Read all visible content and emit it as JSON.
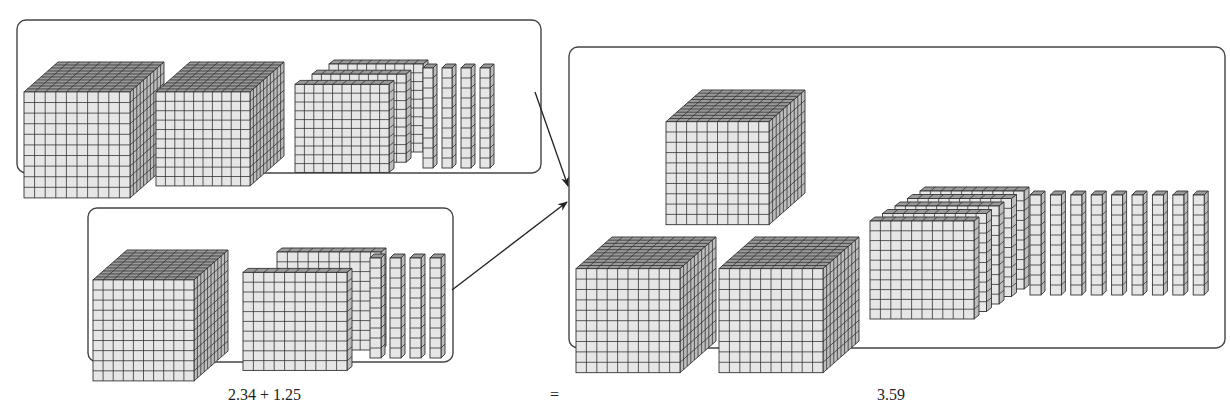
{
  "colors": {
    "face": "#e6e6e6",
    "top": "#9a9a9a",
    "side": "#bdbdbd",
    "line": "#333333",
    "frame": "#444444",
    "text": "#222222"
  },
  "equation": {
    "left": "2.34 + 1.25",
    "equals": "=",
    "result": "3.59"
  },
  "groups": [
    {
      "id": "addend-1",
      "value": "2.34",
      "box": {
        "x": 17,
        "y": 20,
        "w": 524,
        "h": 153
      },
      "ones": 2,
      "tenths": 3,
      "hundredths": 4,
      "cubes": [
        {
          "x": 24,
          "y": 62,
          "s": 106,
          "d": 34
        },
        {
          "x": 156,
          "y": 62,
          "s": 94,
          "d": 34
        }
      ],
      "flats": {
        "x": 295,
        "y": 62,
        "s": 94,
        "d": 34,
        "count": 3
      },
      "rods": {
        "x": 423,
        "y": 62,
        "h": 104,
        "w": 10,
        "gap": 19,
        "count": 4
      }
    },
    {
      "id": "addend-2",
      "value": "1.25",
      "box": {
        "x": 88,
        "y": 208,
        "w": 365,
        "h": 154
      },
      "ones": 1,
      "tenths": 2,
      "hundredths": 5,
      "cubes": [
        {
          "x": 93,
          "y": 250,
          "s": 101,
          "d": 34
        }
      ],
      "flats": {
        "x": 243,
        "y": 250,
        "s": 104,
        "d": 34,
        "count": 2
      },
      "rods": {
        "x": 370,
        "y": 252,
        "h": 104,
        "w": 11,
        "gap": 20,
        "count": 4
      }
    },
    {
      "id": "sum",
      "value": "3.59",
      "box": {
        "x": 569,
        "y": 47,
        "w": 656,
        "h": 301
      },
      "ones": 3,
      "tenths": 5,
      "hundredths": 9,
      "cubes": [
        {
          "x": 666,
          "y": 90,
          "s": 103,
          "d": 36
        },
        {
          "x": 576,
          "y": 237,
          "s": 104,
          "d": 36
        },
        {
          "x": 719,
          "y": 237,
          "s": 104,
          "d": 36
        }
      ],
      "flats": {
        "x": 870,
        "y": 189,
        "s": 104,
        "d": 50,
        "count": 5
      },
      "rods": {
        "x": 1030,
        "y": 189,
        "h": 104,
        "w": 11,
        "gap": 20.4,
        "count": 9
      }
    }
  ],
  "arrows": [
    {
      "from": [
        535,
        92
      ],
      "to": [
        568,
        186
      ]
    },
    {
      "from": [
        452,
        290
      ],
      "to": [
        567,
        202
      ]
    }
  ],
  "labels": [
    {
      "key": "left",
      "x": 228,
      "y": 386
    },
    {
      "key": "equals",
      "x": 550,
      "y": 386
    },
    {
      "key": "result",
      "x": 877,
      "y": 386
    }
  ]
}
